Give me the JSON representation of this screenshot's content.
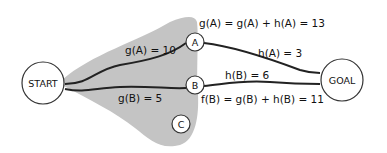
{
  "diagram": {
    "type": "A* search explored region",
    "colors": {
      "region": "#c4c4c4",
      "edge": "#222222",
      "node_fill": "#ffffff",
      "node_stroke": "#333333"
    },
    "nodes": [
      {
        "id": "start",
        "label": "START"
      },
      {
        "id": "goal",
        "label": "GOAL"
      },
      {
        "id": "a",
        "label": "A"
      },
      {
        "id": "b",
        "label": "B"
      },
      {
        "id": "c",
        "label": "C"
      }
    ],
    "edge_labels": {
      "g_a": "g(A) = 10",
      "g_b": "g(B) = 5",
      "h_a": "h(A) = 3",
      "h_b": "h(B) = 6",
      "f_a": "g(A) = g(A) + h(A) = 13",
      "f_b": "f(B) = g(B) + h(B) = 11"
    }
  }
}
